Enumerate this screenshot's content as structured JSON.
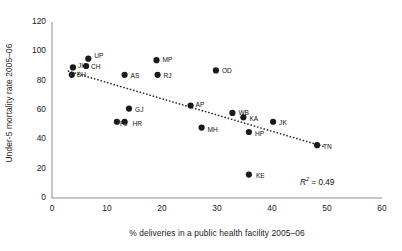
{
  "chart_data": {
    "type": "scatter",
    "title": "",
    "xlabel": "% deliveries in a public health facility 2005–06",
    "ylabel": "Under-5 mortality rate 2005–06",
    "xlim": [
      0,
      60
    ],
    "ylim": [
      0,
      120
    ],
    "xticks": [
      0,
      10,
      20,
      30,
      40,
      50,
      60
    ],
    "yticks": [
      0,
      20,
      40,
      60,
      80,
      100,
      120
    ],
    "grid": false,
    "legend": false,
    "annotations": [
      {
        "name": "r-squared",
        "symbol": "R",
        "superscript": "2",
        "equals": " = ",
        "value": "0.49",
        "text": "R² = 0.49"
      }
    ],
    "trendline": {
      "type": "linear-dotted",
      "x_start": 3.0,
      "y_start": 86.5,
      "x_end": 49.5,
      "y_end": 35.0
    },
    "points": [
      {
        "label": "JH",
        "x": 3.8,
        "y": 89
      },
      {
        "label": "BH",
        "x": 3.6,
        "y": 84
      },
      {
        "label": "UP",
        "x": 6.6,
        "y": 95
      },
      {
        "label": "CH",
        "x": 6.2,
        "y": 90
      },
      {
        "label": "AS",
        "x": 13.2,
        "y": 84
      },
      {
        "label": "MP",
        "x": 19.0,
        "y": 94
      },
      {
        "label": "RJ",
        "x": 19.2,
        "y": 84
      },
      {
        "label": "OD",
        "x": 29.8,
        "y": 87
      },
      {
        "label": "GJ",
        "x": 14.0,
        "y": 61
      },
      {
        "label": "PJ",
        "x": 11.8,
        "y": 52
      },
      {
        "label": "HR",
        "x": 13.2,
        "y": 52
      },
      {
        "label": "AP",
        "x": 25.2,
        "y": 63
      },
      {
        "label": "MH",
        "x": 27.2,
        "y": 48
      },
      {
        "label": "WB",
        "x": 32.8,
        "y": 58
      },
      {
        "label": "KA",
        "x": 34.8,
        "y": 55
      },
      {
        "label": "HP",
        "x": 35.8,
        "y": 45
      },
      {
        "label": "JK",
        "x": 40.2,
        "y": 52
      },
      {
        "label": "TN",
        "x": 48.2,
        "y": 36
      },
      {
        "label": "KE",
        "x": 35.8,
        "y": 16
      }
    ]
  },
  "colors": {
    "point": "#1a1a1a",
    "axis": "#8c8c8c",
    "text": "#1a1a1a",
    "trendline": "#2b2b2b",
    "background": "#ffffff"
  }
}
